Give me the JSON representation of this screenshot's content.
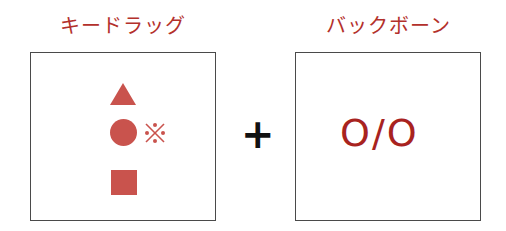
{
  "left": {
    "title": "キードラッグ",
    "symbols": [
      "triangle",
      "circle",
      "kome-mark",
      "square"
    ]
  },
  "operator": "+",
  "right": {
    "title": "バックボーン",
    "notation": "O/O"
  },
  "colors": {
    "title": "#b3302b",
    "shape": "#c9534d",
    "notation": "#a8231f",
    "border": "#4a4a4a"
  }
}
